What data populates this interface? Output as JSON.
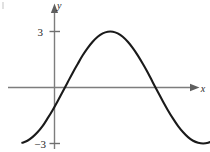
{
  "figure": {
    "axes": {
      "x_axis_label": "x",
      "y_axis_label": "y",
      "x_axis_name": "horizontal-axis",
      "y_axis_name": "vertical-axis",
      "arrow_x_name": "x-axis-arrowhead",
      "arrow_y_name": "y-axis-arrowhead"
    },
    "ticks": {
      "y_positive": "3",
      "y_negative": "−3"
    },
    "icons": {
      "arrow_right": "arrow-right-icon",
      "arrow_up": "arrow-up-icon"
    }
  },
  "chart_data": {
    "type": "line",
    "title": "",
    "subtitle": "",
    "xlabel": "x",
    "ylabel": "y",
    "grid": false,
    "legend": null,
    "xlim": [
      -2.5,
      8.4
    ],
    "ylim": [
      -3.6,
      3.6
    ],
    "yticks": [
      3,
      -3
    ],
    "ytick_labels": [
      "3",
      "−3"
    ],
    "xticks": [],
    "xtick_labels": [],
    "annotations": [],
    "series": [
      {
        "name": "y = 3 cos(2π(x − 2.45)/8.35)",
        "amplitude": 3,
        "period": 8.35,
        "peak": {
          "x": 2.45,
          "y": 3
        },
        "y_intercept": -1.0,
        "x_intercepts": [
          0.4,
          4.5
        ],
        "x": [
          -1.72,
          -1.45,
          -1.18,
          -0.91,
          -0.64,
          -0.38,
          -0.11,
          0.16,
          0.43,
          0.7,
          0.97,
          1.24,
          1.5,
          1.77,
          2.04,
          2.31,
          2.58,
          2.85,
          3.12,
          3.38,
          3.65,
          3.92,
          4.19,
          4.46,
          4.73,
          5.0,
          5.26,
          5.53,
          5.8,
          6.07,
          6.34,
          6.61,
          6.88,
          7.14,
          7.41,
          7.68,
          7.95,
          8.22,
          8.49,
          8.76
        ],
        "y": [
          -2.96,
          -2.85,
          -2.66,
          -2.4,
          -2.07,
          -1.67,
          -1.23,
          -0.75,
          -0.24,
          0.27,
          0.78,
          1.26,
          1.71,
          2.11,
          2.45,
          2.72,
          2.9,
          2.99,
          2.99,
          2.9,
          2.72,
          2.45,
          2.11,
          1.71,
          1.26,
          0.78,
          0.27,
          -0.24,
          -0.75,
          -1.23,
          -1.67,
          -2.07,
          -2.4,
          -2.66,
          -2.85,
          -2.96,
          -3.0,
          -2.96,
          -2.85,
          -2.66
        ]
      }
    ]
  }
}
